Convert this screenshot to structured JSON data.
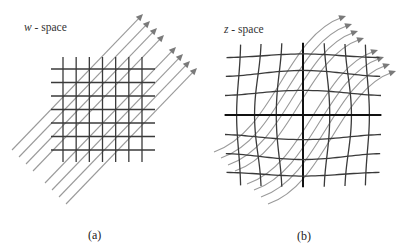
{
  "figure": {
    "panels": [
      {
        "id": "a",
        "space_variable": "w",
        "space_suffix": " - space",
        "caption": "(a)",
        "grid": {
          "type": "regular",
          "vertical_lines": 7,
          "horizontal_lines": 7,
          "warp": "none"
        },
        "flow_bundles": [
          {
            "arrows": 4,
            "direction": "up-right",
            "shape": "straight"
          },
          {
            "arrows": 4,
            "direction": "up-right",
            "shape": "straight"
          }
        ]
      },
      {
        "id": "b",
        "space_variable": "z",
        "space_suffix": " - space",
        "caption": "(b)",
        "grid": {
          "type": "warped",
          "vertical_lines": 7,
          "horizontal_lines": 7,
          "warp": "fisheye-bulge",
          "center_axes_emphasized": true
        },
        "flow_bundles": [
          {
            "arrows": 4,
            "direction": "up-right",
            "shape": "curved"
          },
          {
            "arrows": 4,
            "direction": "up-right",
            "shape": "curved"
          }
        ]
      }
    ],
    "colors": {
      "grid_line": "#3a3a3a",
      "grid_center": "#111111",
      "flow_line": "#9a9a9a",
      "arrow_head": "#7a7a7a",
      "text": "#333333"
    }
  }
}
